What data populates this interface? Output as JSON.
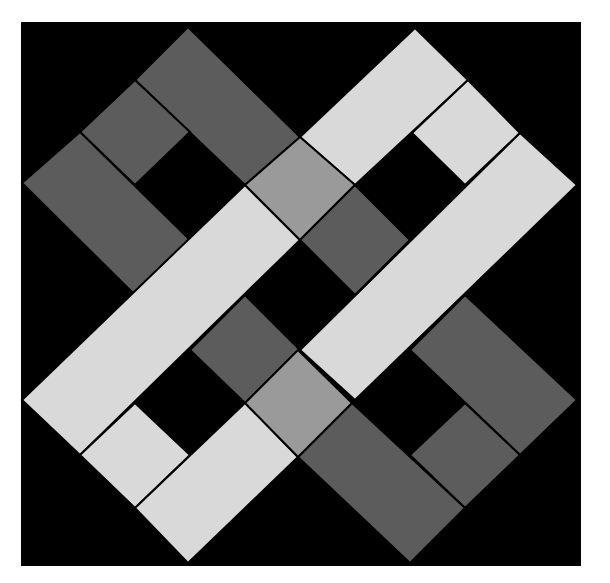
{
  "artwork": {
    "subject": "geometric quilt block",
    "colors": {
      "page": "#ffffff",
      "background": "#000000",
      "dark_gray": "#5c5c5c",
      "medium_gray": "#9a9a9a",
      "light_gray": "#d9d9d9",
      "seam": "#000000"
    },
    "pieces": [
      {
        "name": "upper-left-top-bar",
        "tone": "dark_gray"
      },
      {
        "name": "upper-left-small-square",
        "tone": "dark_gray"
      },
      {
        "name": "upper-left-long-bar",
        "tone": "dark_gray"
      },
      {
        "name": "upper-right-top-bar",
        "tone": "light_gray"
      },
      {
        "name": "upper-right-small-square",
        "tone": "light_gray"
      },
      {
        "name": "rising-band-right",
        "tone": "light_gray"
      },
      {
        "name": "rising-band-left",
        "tone": "light_gray"
      },
      {
        "name": "lower-left-small-square",
        "tone": "light_gray"
      },
      {
        "name": "lower-left-bottom-bar",
        "tone": "light_gray"
      },
      {
        "name": "lower-right-top-bar",
        "tone": "dark_gray"
      },
      {
        "name": "lower-right-small-square",
        "tone": "dark_gray"
      },
      {
        "name": "lower-right-long-bar",
        "tone": "dark_gray"
      },
      {
        "name": "center-upper-square",
        "tone": "medium_gray"
      },
      {
        "name": "center-upper-dark-square",
        "tone": "dark_gray"
      },
      {
        "name": "center-lower-dark-square",
        "tone": "dark_gray"
      },
      {
        "name": "center-lower-square",
        "tone": "medium_gray"
      }
    ]
  }
}
